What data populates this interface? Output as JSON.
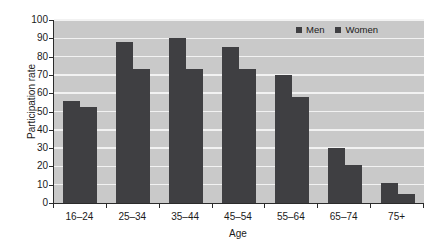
{
  "chart_data": {
    "type": "bar",
    "title": "",
    "xlabel": "Age",
    "ylabel": "Participation rate",
    "categories": [
      "16–24",
      "25–34",
      "35–44",
      "45–54",
      "55–64",
      "65–74",
      "75+"
    ],
    "series": [
      {
        "name": "Men",
        "values": [
          56,
          88,
          90,
          85,
          70,
          30,
          11
        ]
      },
      {
        "name": "Women",
        "values": [
          52.5,
          73,
          73,
          73,
          58,
          21,
          5
        ]
      }
    ],
    "ylim": [
      0,
      100
    ],
    "yticks": [
      0,
      10,
      20,
      30,
      40,
      50,
      60,
      70,
      80,
      90,
      100
    ],
    "ytick_labels": [
      "0",
      "10",
      "20",
      "30",
      "40",
      "50",
      "60",
      "70",
      "80",
      "90",
      "100"
    ],
    "grid": "horizontal",
    "legend_position": "top-right",
    "colors": {
      "bar": "#3f3f42",
      "plot_background": "#c9c9c9",
      "gridline": "#f2f2f2",
      "axis": "#2b2b2b",
      "text": "#1b1b1b",
      "figure_background": "#ffffff"
    }
  },
  "legend": {
    "entries": [
      {
        "label": "Men"
      },
      {
        "label": "Women"
      }
    ]
  }
}
